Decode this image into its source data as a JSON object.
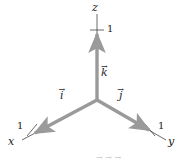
{
  "figure": {
    "type": "3d-coordinate-axes-diagram",
    "background_color": "#ffffff",
    "vector_color": "#9a9a9a",
    "axis_line_color": "#2b2b2b",
    "text_color": "#1a1a1a"
  },
  "axes": [
    {
      "key": "x",
      "label": "x",
      "tick_label": "1",
      "direction": "lower-left"
    },
    {
      "key": "y",
      "label": "y",
      "tick_label": "1",
      "direction": "lower-right"
    },
    {
      "key": "z",
      "label": "z",
      "tick_label": "1",
      "direction": "up"
    }
  ],
  "vectors": [
    {
      "key": "i",
      "letter": "i",
      "arrow": "→",
      "along_axis": "x"
    },
    {
      "key": "j",
      "letter": "j",
      "arrow": "→",
      "along_axis": "y"
    },
    {
      "key": "k",
      "letter": "k",
      "arrow": "→",
      "along_axis": "z"
    }
  ],
  "caption": {
    "cut_off_text": "→  →      →"
  }
}
